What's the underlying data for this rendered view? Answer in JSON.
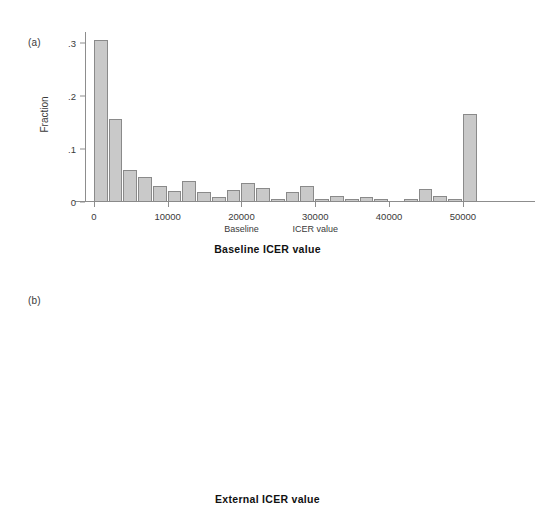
{
  "figure": {
    "panels": [
      {
        "letter": "(a)",
        "caption": "Baseline ICER value"
      },
      {
        "letter": "(b)",
        "caption": "External ICER value"
      }
    ]
  },
  "chart_data": [
    {
      "type": "bar",
      "panel": "(a)",
      "title": "Baseline ICER value",
      "xlabel": "Baseline ICER value",
      "ylabel": "Fraction",
      "xlim": [
        -1200,
        53000
      ],
      "ylim": [
        0,
        0.32
      ],
      "bin_width": 2000,
      "grid": false,
      "legend": null,
      "xticks": [
        0,
        10000,
        20000,
        30000,
        40000,
        50000
      ],
      "xticklabels": [
        "0",
        "10000",
        "20000",
        "30000",
        "40000",
        "50000"
      ],
      "yticks": [
        0,
        0.1,
        0.2,
        0.3
      ],
      "yticklabels": [
        "0",
        ".1",
        ".2",
        ".3"
      ],
      "annotations": [
        {
          "text": "Baseline",
          "x": 20000
        },
        {
          "text": "ICER value",
          "x": 30000
        }
      ],
      "x": [
        1000,
        3000,
        5000,
        7000,
        9000,
        11000,
        13000,
        15000,
        17000,
        19000,
        21000,
        23000,
        25000,
        27000,
        29000,
        31000,
        33000,
        35000,
        37000,
        39000,
        41000,
        43000,
        45000,
        47000,
        49000,
        51000
      ],
      "categories": [
        "0-2000",
        "2000-4000",
        "4000-6000",
        "6000-8000",
        "8000-10000",
        "10000-12000",
        "12000-14000",
        "14000-16000",
        "16000-18000",
        "18000-20000",
        "20000-22000",
        "22000-24000",
        "24000-26000",
        "26000-28000",
        "28000-30000",
        "30000-32000",
        "32000-34000",
        "34000-36000",
        "36000-38000",
        "38000-40000",
        "40000-42000",
        "42000-44000",
        "44000-46000",
        "46000-48000",
        "48000-50000",
        "50000+"
      ],
      "values": [
        0.305,
        0.157,
        0.061,
        0.048,
        0.03,
        0.021,
        0.039,
        0.019,
        0.01,
        0.023,
        0.035,
        0.027,
        0.003,
        0.018,
        0.031,
        0.005,
        0.012,
        0.003,
        0.009,
        0.003,
        0.0,
        0.004,
        0.025,
        0.012,
        0.003,
        0.166
      ]
    },
    {
      "type": "bar",
      "panel": "(b)",
      "title": "External ICER value",
      "xlabel": "External ICER value",
      "ylabel": "Fraction",
      "xlim": [
        -1200,
        53000
      ],
      "ylim": [
        0,
        0.32
      ],
      "bin_width": 2000,
      "grid": false,
      "legend": null,
      "xticks": [
        0,
        10000,
        20000,
        30000,
        40000,
        50000
      ],
      "xticklabels": [
        "0",
        "10000",
        "20000",
        "30000",
        "40000",
        "50000"
      ],
      "yticks": [
        0,
        0.1,
        0.2,
        0.3
      ],
      "yticklabels": [
        "0",
        ".1",
        ".2",
        ".3"
      ],
      "annotations": [],
      "x": [
        1000,
        3000,
        5000,
        7000,
        9000,
        11000,
        13000,
        15000,
        17000,
        19000,
        21000,
        23000,
        25000,
        27000,
        29000,
        31000,
        33000,
        35000,
        37000,
        39000,
        41000,
        43000,
        45000,
        47000,
        49000,
        51000
      ],
      "categories": [
        "0-2000",
        "2000-4000",
        "4000-6000",
        "6000-8000",
        "8000-10000",
        "10000-12000",
        "12000-14000",
        "14000-16000",
        "16000-18000",
        "18000-20000",
        "20000-22000",
        "22000-24000",
        "24000-26000",
        "26000-28000",
        "28000-30000",
        "30000-32000",
        "32000-34000",
        "34000-36000",
        "36000-38000",
        "38000-40000",
        "40000-42000",
        "42000-44000",
        "44000-46000",
        "46000-48000",
        "48000-50000",
        "50000+"
      ],
      "values": [
        0.261,
        0.1,
        0.061,
        0.141,
        0.051,
        0.095,
        0.039,
        0.028,
        0.01,
        0.01,
        0.016,
        0.042,
        0.071,
        0.024,
        0.062,
        0.008,
        0.009,
        0.013,
        0.018,
        0.004,
        0.004,
        0.004,
        0.004,
        0.004,
        0.005,
        0.076
      ]
    }
  ],
  "colors": {
    "bar_fill": "#c9c9c9",
    "bar_stroke": "#8a8a8a",
    "axis": "#8d8d8d",
    "text": "#3a3a3a",
    "caption": "#111111"
  }
}
